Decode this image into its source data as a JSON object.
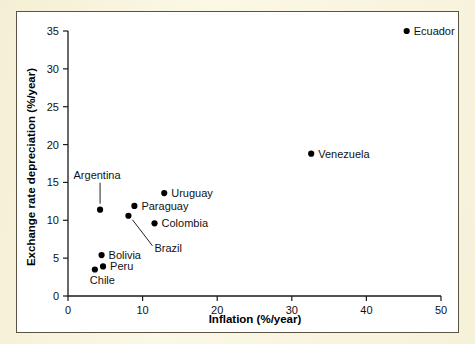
{
  "figure": {
    "panel_background": "#ffffff",
    "page_background": "#faf6de",
    "border_color": "#5a5242"
  },
  "chart_data": {
    "type": "scatter",
    "title": "",
    "xlabel": "Inflation (%/year)",
    "ylabel": "Exchange rate depreciation (%/year)",
    "xlim": [
      0,
      50
    ],
    "ylim": [
      0,
      35
    ],
    "xticks": [
      0,
      10,
      20,
      30,
      40,
      50
    ],
    "yticks": [
      0,
      5,
      10,
      15,
      20,
      25,
      30,
      35
    ],
    "xticklabels": [
      "0",
      "10",
      "20",
      "30",
      "40",
      "50"
    ],
    "yticklabels": [
      "0",
      "5",
      "10",
      "15",
      "20",
      "25",
      "30",
      "35"
    ],
    "grid": false,
    "legend": "none",
    "marker": "filled-circle",
    "marker_color": "#000000",
    "points": [
      {
        "label": "Ecuador",
        "x": 45.4,
        "y": 35.0,
        "label_pos": "right",
        "leader": false
      },
      {
        "label": "Venezuela",
        "x": 32.6,
        "y": 18.8,
        "label_pos": "right",
        "leader": false
      },
      {
        "label": "Uruguay",
        "x": 12.9,
        "y": 13.6,
        "label_pos": "right",
        "leader": false
      },
      {
        "label": "Paraguay",
        "x": 8.9,
        "y": 11.9,
        "label_pos": "right",
        "leader": false
      },
      {
        "label": "Argentina",
        "x": 4.3,
        "y": 11.4,
        "label_pos": "above",
        "leader": true
      },
      {
        "label": "Brazil",
        "x": 8.1,
        "y": 10.6,
        "label_pos": "below-right",
        "leader": true
      },
      {
        "label": "Colombia",
        "x": 11.6,
        "y": 9.6,
        "label_pos": "right",
        "leader": false
      },
      {
        "label": "Bolivia",
        "x": 4.5,
        "y": 5.4,
        "label_pos": "right",
        "leader": false
      },
      {
        "label": "Peru",
        "x": 4.7,
        "y": 3.9,
        "label_pos": "right",
        "leader": false
      },
      {
        "label": "Chile",
        "x": 3.6,
        "y": 3.5,
        "label_pos": "below",
        "leader": false
      }
    ]
  }
}
